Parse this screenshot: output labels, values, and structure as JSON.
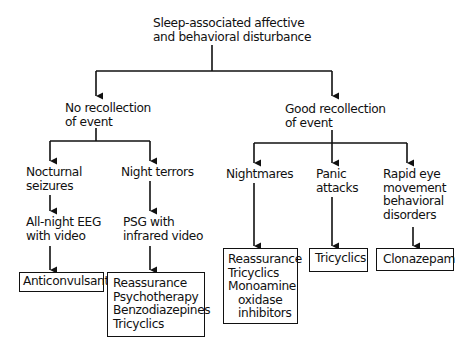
{
  "root": {
    "lines": [
      "Sleep-associated affective",
      "and behavioral disturbance"
    ]
  },
  "branches": {
    "no_recollection": {
      "lines": [
        "No recollection",
        "of event"
      ],
      "children": {
        "nocturnal_seizures": {
          "lines": [
            "Nocturnal",
            "seizures"
          ],
          "test": {
            "lines": [
              "All-night EEG",
              "with video"
            ]
          },
          "treatment": {
            "lines": [
              "Anticonvulsants"
            ]
          }
        },
        "night_terrors": {
          "lines": [
            "Night terrors"
          ],
          "test": {
            "lines": [
              "PSG with",
              "infrared video"
            ]
          },
          "treatment": {
            "lines": [
              "Reassurance",
              "Psychotherapy",
              "Benzodiazepines",
              "Tricyclics"
            ]
          }
        }
      }
    },
    "good_recollection": {
      "lines": [
        "Good recollection",
        "of event"
      ],
      "children": {
        "nightmares": {
          "lines": [
            "Nightmares"
          ],
          "treatment": {
            "lines": [
              "Reassurance",
              "Tricyclics",
              "Monoamine",
              "oxidase",
              "inhibitors"
            ]
          }
        },
        "panic_attacks": {
          "lines": [
            "Panic",
            "attacks"
          ],
          "treatment": {
            "lines": [
              "Tricyclics"
            ]
          }
        },
        "rem_behavior_disorders": {
          "lines": [
            "Rapid eye",
            "movement",
            "behavioral",
            "disorders"
          ],
          "treatment": {
            "lines": [
              "Clonazepam"
            ]
          }
        }
      }
    }
  },
  "colors": {
    "line": "#111111",
    "text": "#111111",
    "background": "#ffffff"
  }
}
